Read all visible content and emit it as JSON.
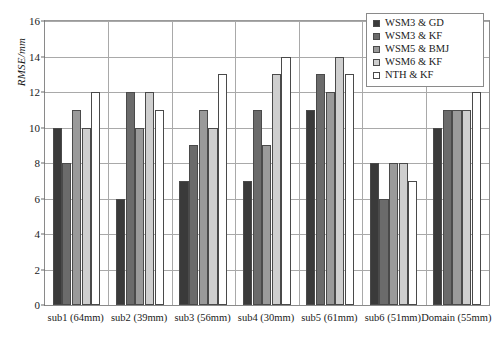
{
  "chart_data": {
    "type": "bar",
    "title": "",
    "xlabel": "",
    "ylabel": "RMSE/mm",
    "ylim": [
      0,
      16
    ],
    "ytick_step": 2,
    "yticks": [
      0,
      2,
      4,
      6,
      8,
      10,
      12,
      14,
      16
    ],
    "ytick_labels": [
      "0",
      "2",
      "4",
      "6",
      "8",
      "10",
      "12",
      "14",
      "16"
    ],
    "grid": true,
    "grid_axis": "y",
    "legend_position": "top-right",
    "categories": [
      "sub1 (64mm)",
      "sub2 (39mm)",
      "sub3 (56mm)",
      "sub4 (30mm)",
      "sub5 (61mm)",
      "sub6 (51mm)",
      "Domain (55mm)"
    ],
    "series": [
      {
        "name": "WSM3 & GD",
        "color": "#3a3a3a",
        "values": [
          10,
          6,
          7,
          7,
          11,
          8,
          10
        ]
      },
      {
        "name": "WSM3 & KF",
        "color": "#6b6b6b",
        "values": [
          8,
          12,
          9,
          11,
          13,
          6,
          11
        ]
      },
      {
        "name": "WSM5 & BMJ",
        "color": "#9a9a9a",
        "values": [
          11,
          10,
          11,
          9,
          12,
          8,
          11
        ]
      },
      {
        "name": "WSM6 & KF",
        "color": "#cfcfcf",
        "values": [
          10,
          12,
          10,
          13,
          14,
          8,
          11
        ]
      },
      {
        "name": "NTH & KF",
        "color": "#ffffff",
        "values": [
          12,
          11,
          13,
          14,
          13,
          7,
          12
        ]
      }
    ]
  },
  "axis": {
    "y_title": "RMSE/mm"
  }
}
